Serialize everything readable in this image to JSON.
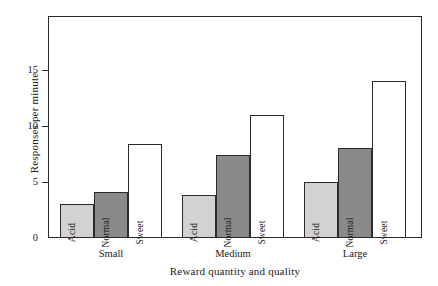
{
  "chart_data": {
    "type": "bar",
    "title": "",
    "xlabel": "Reward quantity and quality",
    "ylabel": "Responses per minute",
    "categories": [
      "Small",
      "Medium",
      "Large"
    ],
    "series": [
      {
        "name": "Acid",
        "values": [
          3.0,
          3.8,
          5.0
        ],
        "color": "#d2d2d2"
      },
      {
        "name": "Normal",
        "values": [
          4.1,
          7.4,
          8.0
        ],
        "color": "#8a8a8a"
      },
      {
        "name": "Sweet",
        "values": [
          8.4,
          11.0,
          14.0
        ],
        "color": "#ffffff"
      }
    ],
    "ylim": [
      0,
      19.8
    ],
    "yticks": [
      0,
      5,
      10,
      15
    ],
    "ytick_labels": [
      "0",
      "5",
      "10",
      "15"
    ],
    "grid": false,
    "legend": "none",
    "bar_labels_inside": true,
    "axis_color": "#2b2b2b",
    "background": "#ffffff"
  },
  "axes": {
    "y_title": "Responses per minute",
    "x_title": "Reward quantity and quality",
    "y_tick_0": "0",
    "y_tick_1": "5",
    "y_tick_2": "10",
    "y_tick_3": "15"
  },
  "groups": {
    "g0": "Small",
    "g1": "Medium",
    "g2": "Large"
  },
  "bar_names": {
    "acid": "Acid",
    "normal": "Normal",
    "sweet": "Sweet"
  }
}
